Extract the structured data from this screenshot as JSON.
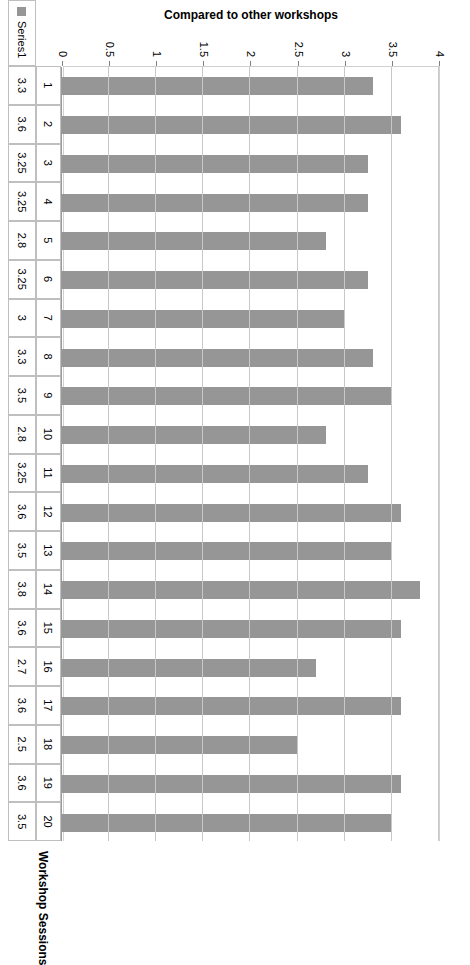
{
  "chart_data": {
    "type": "bar",
    "orientation": "horizontal",
    "title": "",
    "xlabel": "Compared to other workshops",
    "ylabel": "Workshop Sessions",
    "xlim": [
      0,
      4
    ],
    "grid": true,
    "legend_position": "bottom",
    "categories": [
      "1",
      "2",
      "3",
      "4",
      "5",
      "6",
      "7",
      "8",
      "9",
      "10",
      "11",
      "12",
      "13",
      "14",
      "15",
      "16",
      "17",
      "18",
      "19",
      "20"
    ],
    "values": [
      3.3,
      3.6,
      3.25,
      3.25,
      2.8,
      3.25,
      3,
      3.3,
      3.5,
      2.8,
      3.25,
      3.6,
      3.5,
      3.8,
      3.6,
      2.7,
      3.6,
      2.5,
      3.6,
      3.5
    ],
    "value_labels": [
      "3.3",
      "3.6",
      "3.25",
      "3.25",
      "2.8",
      "3.25",
      "3",
      "3.3",
      "3.5",
      "2.8",
      "3.25",
      "3.6",
      "3.5",
      "3.8",
      "3.6",
      "2.7",
      "3.6",
      "2.5",
      "3.6",
      "3.5"
    ],
    "tick_labels": [
      "0",
      "0.5",
      "1",
      "1.5",
      "2",
      "2.5",
      "3",
      "3.5",
      "4"
    ],
    "tick_values": [
      0,
      0.5,
      1,
      1.5,
      2,
      2.5,
      3,
      3.5,
      4
    ],
    "series": [
      {
        "name": "Series1",
        "color": "#969696",
        "values": [
          3.3,
          3.6,
          3.25,
          3.25,
          2.8,
          3.25,
          3,
          3.3,
          3.5,
          2.8,
          3.25,
          3.6,
          3.5,
          3.8,
          3.6,
          2.7,
          3.6,
          2.5,
          3.6,
          3.5
        ]
      }
    ],
    "data_table_shown": true
  },
  "axes": {
    "value_axis_title": "Compared to other workshops",
    "category_axis_title": "Workshop Sessions"
  },
  "legend": {
    "series_label": "Series1"
  },
  "colors": {
    "bar": "#969696",
    "gridline": "#c8c8c8",
    "axis": "#9a9a9a",
    "table_border": "#bfbfbf",
    "text": "#000000",
    "background": "#ffffff"
  }
}
